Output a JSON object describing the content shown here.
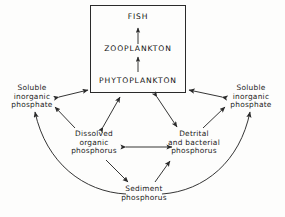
{
  "diagram": {
    "type": "cycle-flow-diagram",
    "stroke_color": "#2a2a2a",
    "text_color": "#1a1a1a",
    "background_color": "#fdfdfc"
  },
  "trophic_box": {
    "fish": "FISH",
    "zooplankton": "ZOOPLANKTON",
    "phytoplankton": "PHYTOPLANKTON"
  },
  "nodes": {
    "soluble_left": "Soluble\ninorganic\nphosphate",
    "soluble_right": "Soluble\ninorganic\nphosphate",
    "dissolved_organic": "Dissolved\norganic\nphosphorus",
    "detrital_bacterial": "Detrital\nand bacterial\nphosphorus",
    "sediment": "Sediment\nphosphorus"
  },
  "arrows": [
    {
      "name": "phytoplankton-to-zooplankton",
      "direction": "one-way"
    },
    {
      "name": "zooplankton-to-fish",
      "direction": "one-way"
    },
    {
      "name": "soluble-left-to-box",
      "direction": "two-way"
    },
    {
      "name": "soluble-right-to-box",
      "direction": "two-way"
    },
    {
      "name": "dissolved-organic-to-box",
      "direction": "two-way"
    },
    {
      "name": "box-to-detrital",
      "direction": "two-way"
    },
    {
      "name": "dissolved-organic-to-soluble-left",
      "direction": "one-way"
    },
    {
      "name": "detrital-to-soluble-right",
      "direction": "one-way"
    },
    {
      "name": "dissolved-organic-to-detrital",
      "direction": "two-way"
    },
    {
      "name": "dissolved-organic-to-sediment",
      "direction": "one-way"
    },
    {
      "name": "sediment-to-detrital",
      "direction": "one-way"
    },
    {
      "name": "sediment-curve-to-soluble-left",
      "direction": "one-way"
    },
    {
      "name": "sediment-curve-to-soluble-right",
      "direction": "one-way"
    }
  ]
}
